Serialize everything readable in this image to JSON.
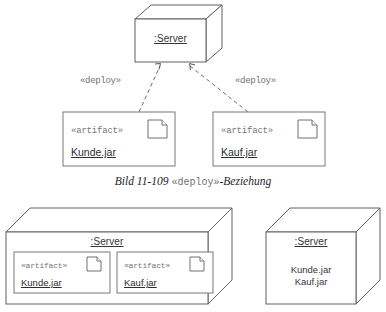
{
  "diagram": {
    "caption_prefix": "Bild 11-109 ",
    "caption_stereotype": "«deploy»",
    "caption_suffix": "-Beziehung",
    "stereotype_artifact": "«artifact»",
    "stereotype_deploy": "«deploy»",
    "colors": {
      "background": "#ffffff",
      "stroke": "#5f6166",
      "stroke_light": "#76787d",
      "text": "#2e3034",
      "text_muted": "#75777c"
    }
  },
  "top_figure": {
    "server_node": {
      "label": ":Server"
    },
    "dependencies": [
      {
        "label": "«deploy»",
        "from": "Kunde.jar",
        "to": ":Server"
      },
      {
        "label": "«deploy»",
        "from": "Kauf.jar",
        "to": ":Server"
      }
    ],
    "artifacts": [
      {
        "stereotype": "«artifact»",
        "name": "Kunde.jar",
        "icon": "artifact-document-icon"
      },
      {
        "stereotype": "«artifact»",
        "name": "Kauf.jar",
        "icon": "artifact-document-icon"
      }
    ]
  },
  "bottom_left_figure": {
    "server_node": {
      "label": ":Server"
    },
    "artifacts": [
      {
        "stereotype": "«artifact»",
        "name": "Kunde.jar",
        "icon": "artifact-document-icon"
      },
      {
        "stereotype": "«artifact»",
        "name": "Kauf.jar",
        "icon": "artifact-document-icon"
      }
    ]
  },
  "bottom_right_figure": {
    "server_node": {
      "label": ":Server"
    },
    "artifact_names": [
      "Kunde.jar",
      "Kauf.jar"
    ]
  }
}
